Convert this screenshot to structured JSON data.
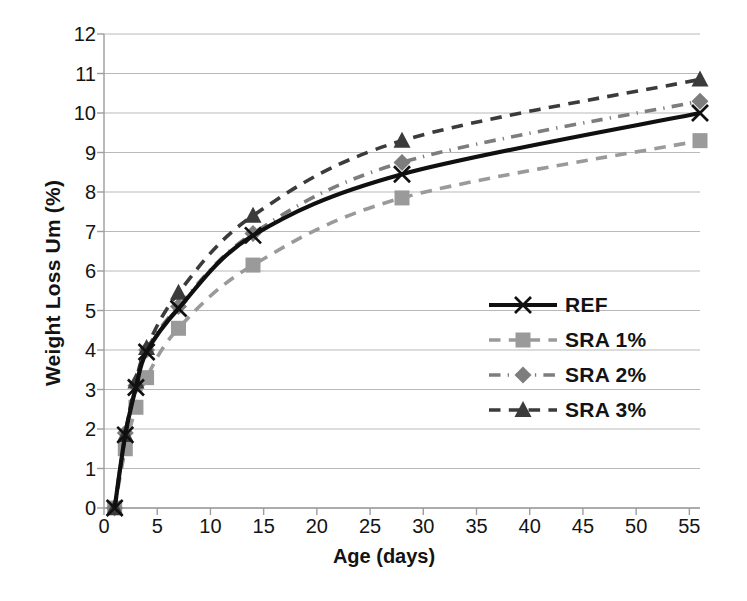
{
  "chart_data": {
    "type": "line",
    "title": "",
    "xlabel": "Age (days)",
    "ylabel": "Weight Loss Um (%)",
    "xlim": [
      0,
      56
    ],
    "ylim": [
      0,
      12
    ],
    "xticks": [
      0,
      5,
      10,
      15,
      20,
      25,
      30,
      35,
      40,
      45,
      50,
      55
    ],
    "yticks": [
      0,
      1,
      2,
      3,
      4,
      5,
      6,
      7,
      8,
      9,
      10,
      11,
      12
    ],
    "grid": "horizontal",
    "legend_position": "inside-right-center",
    "x": [
      1,
      2,
      3,
      4,
      7,
      14,
      28,
      56
    ],
    "series": [
      {
        "name": "REF",
        "values": [
          0.0,
          1.85,
          3.05,
          3.95,
          5.05,
          6.9,
          8.45,
          10.0
        ],
        "color": "#101010",
        "linestyle": "solid",
        "marker": "x"
      },
      {
        "name": "SRA 1%",
        "values": [
          0.0,
          1.5,
          2.55,
          3.3,
          4.55,
          6.15,
          7.85,
          9.3
        ],
        "color": "#9a9a9a",
        "linestyle": "dashed",
        "marker": "square"
      },
      {
        "name": "SRA 2%",
        "values": [
          0.0,
          1.9,
          3.1,
          4.0,
          5.1,
          6.95,
          8.75,
          10.3
        ],
        "color": "#7d7d7d",
        "linestyle": "dashdot",
        "marker": "diamond"
      },
      {
        "name": "SRA 3%",
        "values": [
          0.0,
          1.85,
          3.2,
          4.05,
          5.45,
          7.4,
          9.3,
          10.85
        ],
        "color": "#3b3b3b",
        "linestyle": "dashed",
        "marker": "triangle"
      }
    ]
  },
  "axes": {
    "y_title": "Weight Loss Um (%)",
    "x_title": "Age (days)"
  },
  "legend": {
    "items": [
      {
        "label": "REF"
      },
      {
        "label": "SRA 1%"
      },
      {
        "label": "SRA 2%"
      },
      {
        "label": "SRA 3%"
      }
    ]
  },
  "style": {
    "gridline_color": "#b9b9b9",
    "axis_color": "#9d9d9d",
    "background": "#ffffff"
  }
}
